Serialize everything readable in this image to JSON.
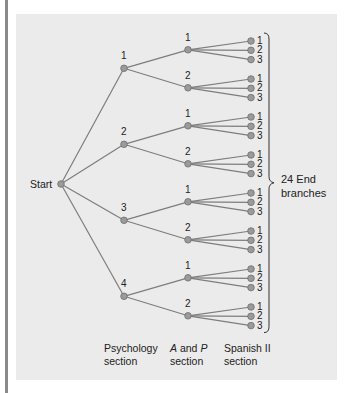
{
  "diagram": {
    "type": "tree",
    "root_label": "Start",
    "levels": [
      {
        "name": "Psychology section",
        "options": [
          "1",
          "2",
          "3",
          "4"
        ]
      },
      {
        "name": "A and P section",
        "options": [
          "1",
          "2"
        ]
      },
      {
        "name": "Spanish II section",
        "options": [
          "1",
          "2",
          "3"
        ]
      }
    ],
    "end_label_line1": "24 End",
    "end_label_line2": "branches",
    "axis": {
      "psych_line1": "Psychology",
      "psych_line2": "section",
      "ap_a": "A",
      "ap_and": " and ",
      "ap_p": "P",
      "ap_line2": "section",
      "spanish_line1": "Spanish II",
      "spanish_line2": "section"
    },
    "colors": {
      "panel": "#ebebeb",
      "line": "#7d7d7d",
      "node_fill": "#9a9a9a",
      "node_stroke": "#6e6e6e",
      "side_bar": "#8a8a8a"
    }
  }
}
